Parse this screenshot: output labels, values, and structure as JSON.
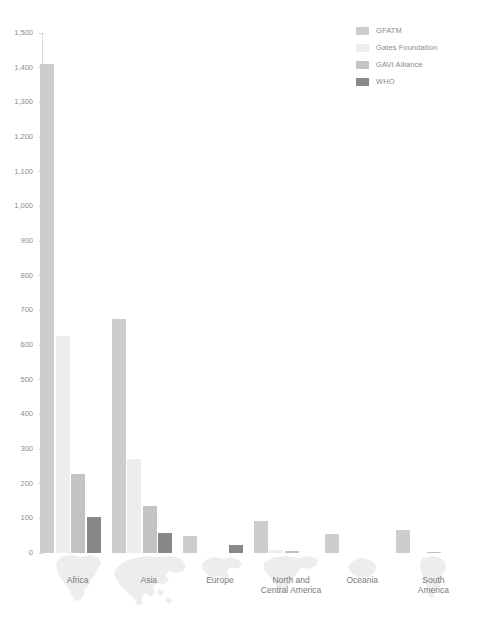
{
  "chart_data": {
    "type": "bar",
    "title": "",
    "subtitle": "",
    "xlabel": "",
    "ylabel": "",
    "ylim": [
      0,
      1500
    ],
    "ytick_step": 100,
    "grid": false,
    "legend_position": "top-right",
    "categories": [
      "Africa",
      "Asia",
      "Europe",
      "North and Central America",
      "Oceania",
      "South America"
    ],
    "ytick_labels": [
      "1,500",
      "1,400",
      "1,300",
      "1,200",
      "1,100",
      "1,000",
      "900",
      "800",
      "700",
      "600",
      "500",
      "400",
      "300",
      "200",
      "100",
      "0"
    ],
    "ytick_values": [
      1500,
      1400,
      1300,
      1200,
      1100,
      1000,
      900,
      800,
      700,
      600,
      500,
      400,
      300,
      200,
      100,
      0
    ],
    "series": [
      {
        "name": "GFATM",
        "color": "#cdcdcd",
        "values": [
          1410,
          675,
          50,
          93,
          54,
          66
        ]
      },
      {
        "name": "Gates Foundation",
        "color": "#ededed",
        "values": [
          625,
          270,
          0,
          9,
          0,
          0
        ]
      },
      {
        "name": "GAVI Alliance",
        "color": "#c3c3c3",
        "values": [
          227,
          137,
          0,
          5,
          0,
          4
        ]
      },
      {
        "name": "WHO",
        "color": "#888888",
        "values": [
          105,
          57,
          22,
          0,
          0,
          0
        ]
      }
    ]
  },
  "legend": {
    "items": [
      {
        "label": "GFATM",
        "color": "#cdcdcd"
      },
      {
        "label": "Gates Foundation",
        "color": "#ededed"
      },
      {
        "label": "GAVI Alliance",
        "color": "#c3c3c3"
      },
      {
        "label": "WHO",
        "color": "#888888"
      }
    ]
  },
  "x_axis": {
    "categories": [
      {
        "label": "Africa",
        "icon": "africa-map-icon"
      },
      {
        "label": "Asia",
        "icon": "asia-map-icon"
      },
      {
        "label": "Europe",
        "icon": "europe-map-icon"
      },
      {
        "label": "North and\nCentral America",
        "icon": "north-america-map-icon"
      },
      {
        "label": "Oceania",
        "icon": "oceania-map-icon"
      },
      {
        "label": "South\nAmerica",
        "icon": "south-america-map-icon"
      }
    ]
  }
}
